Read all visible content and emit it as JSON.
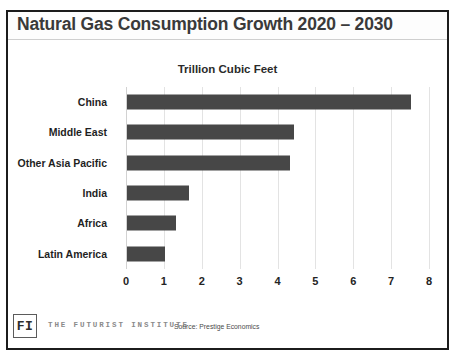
{
  "slide": {
    "title": "Natural Gas Consumption Growth 2020 – 2030"
  },
  "footer": {
    "logo_text": "FI",
    "institute_name": "THE FUTURIST INSTITUTE",
    "source": "Source: Prestige Economics"
  },
  "chart_data": {
    "type": "bar",
    "orientation": "horizontal",
    "title": "Trillion Cubic Feet",
    "xlabel": "",
    "ylabel": "",
    "xlim": [
      0,
      8
    ],
    "xticks": [
      0,
      1,
      2,
      3,
      4,
      5,
      6,
      7,
      8
    ],
    "xtick_labels": [
      "0",
      "1",
      "2",
      "3",
      "4",
      "5",
      "6",
      "7",
      "8"
    ],
    "grid": true,
    "legend": false,
    "bar_color": "#474747",
    "categories": [
      "China",
      "Middle East",
      "Other Asia Pacific",
      "India",
      "Africa",
      "Latin America"
    ],
    "values": [
      7.5,
      4.4,
      4.3,
      1.65,
      1.3,
      1.0
    ]
  }
}
